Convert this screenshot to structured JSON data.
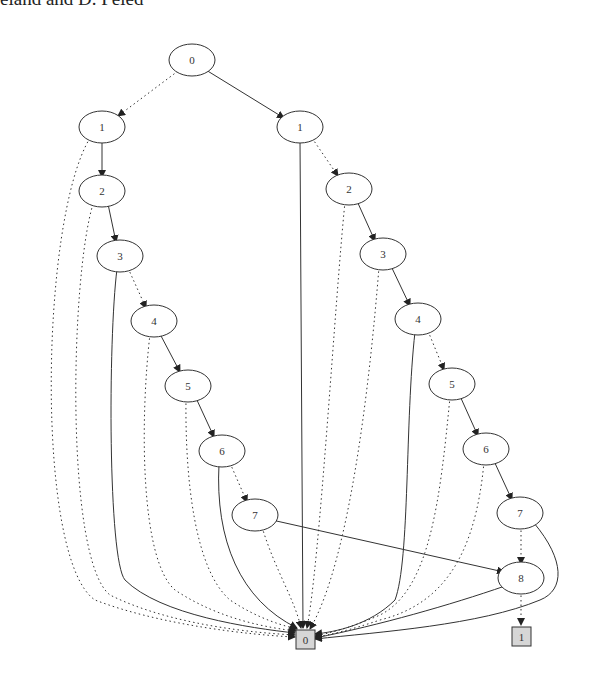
{
  "caption": "eland and D. Peled",
  "diagram": {
    "type": "binary-decision-diagram",
    "nodes": [
      {
        "id": "r0",
        "label": "0",
        "x": 192,
        "y": 60
      },
      {
        "id": "l1",
        "label": "1",
        "x": 102,
        "y": 127
      },
      {
        "id": "l2",
        "label": "2",
        "x": 102,
        "y": 191
      },
      {
        "id": "l3",
        "label": "3",
        "x": 120,
        "y": 256
      },
      {
        "id": "l4",
        "label": "4",
        "x": 154,
        "y": 321
      },
      {
        "id": "l5",
        "label": "5",
        "x": 188,
        "y": 386
      },
      {
        "id": "l6",
        "label": "6",
        "x": 222,
        "y": 451
      },
      {
        "id": "l7",
        "label": "7",
        "x": 255,
        "y": 515
      },
      {
        "id": "m1",
        "label": "1",
        "x": 300,
        "y": 127
      },
      {
        "id": "m2",
        "label": "2",
        "x": 349,
        "y": 189
      },
      {
        "id": "m3",
        "label": "3",
        "x": 383,
        "y": 254
      },
      {
        "id": "m4",
        "label": "4",
        "x": 418,
        "y": 319
      },
      {
        "id": "m5",
        "label": "5",
        "x": 452,
        "y": 384
      },
      {
        "id": "m6",
        "label": "6",
        "x": 486,
        "y": 449
      },
      {
        "id": "m7",
        "label": "7",
        "x": 520,
        "y": 513
      },
      {
        "id": "n8",
        "label": "8",
        "x": 521,
        "y": 578
      }
    ],
    "terminals": [
      {
        "id": "t0",
        "label": "0",
        "x": 305,
        "y": 639
      },
      {
        "id": "t1",
        "label": "1",
        "x": 521,
        "y": 636
      }
    ],
    "legend": {
      "solid": "high (1) edge",
      "dotted": "low (0) edge"
    }
  }
}
